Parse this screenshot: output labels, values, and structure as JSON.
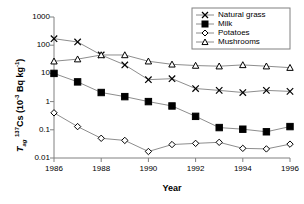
{
  "chart_data": {
    "type": "line",
    "title": "",
    "xlabel": "Year",
    "ylabel": "Tag 137Cs (10-3 Bq kg-1)",
    "ylabel_parts": {
      "t": "T",
      "ag": "ag",
      "sup137": "137",
      "cs": "Cs (10",
      "supminus3": "-3",
      "tail": " Bq kg",
      "supminus1": "-1",
      "close": ")"
    },
    "x": [
      1986,
      1987,
      1988,
      1989,
      1990,
      1991,
      1992,
      1993,
      1994,
      1995,
      1996
    ],
    "xticklabels": [
      "1986",
      "1988",
      "1990",
      "1992",
      "1994",
      "1996"
    ],
    "xticks": [
      1986,
      1988,
      1990,
      1992,
      1994,
      1996
    ],
    "xlim": [
      1986,
      1996
    ],
    "yticklabels": [
      "1000",
      "100",
      "10",
      "1",
      "0.1",
      "0.01"
    ],
    "yticks": [
      1000,
      100,
      10,
      1,
      0.1,
      0.01
    ],
    "ylim": [
      0.01,
      1000
    ],
    "yscale": "log",
    "grid": false,
    "legend_position": "top-right",
    "series": [
      {
        "name": "Natural grass",
        "marker": "x",
        "values": [
          170,
          130,
          45,
          20,
          6.0,
          6.5,
          2.9,
          2.5,
          2.1,
          2.5,
          2.3
        ]
      },
      {
        "name": "Milk",
        "marker": "filled-square",
        "values": [
          10,
          5.0,
          2.1,
          1.5,
          1.0,
          0.7,
          0.3,
          0.12,
          0.105,
          0.085,
          0.13
        ]
      },
      {
        "name": "Potatoes",
        "marker": "open-diamond",
        "values": [
          0.4,
          0.13,
          0.05,
          0.042,
          0.017,
          0.03,
          0.033,
          0.036,
          0.022,
          0.021,
          0.031
        ]
      },
      {
        "name": "Mushrooms",
        "marker": "open-triangle",
        "values": [
          27,
          32,
          45,
          45,
          27,
          21,
          19,
          18,
          20,
          18,
          16
        ]
      }
    ]
  },
  "legend": {
    "items": [
      {
        "label": "Natural grass",
        "marker": "x"
      },
      {
        "label": "Milk",
        "marker": "filled-square"
      },
      {
        "label": "Potatoes",
        "marker": "open-diamond"
      },
      {
        "label": "Mushrooms",
        "marker": "open-triangle"
      }
    ]
  },
  "colors": {
    "axis": "#808080",
    "line": "#808080",
    "marker": "#000000",
    "text": "#000000",
    "background": "#ffffff"
  }
}
